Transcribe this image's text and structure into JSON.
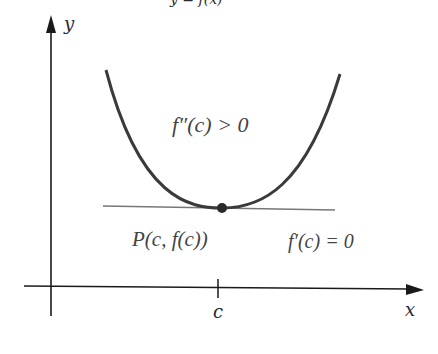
{
  "top_caption_fragment": "y = f(x)",
  "axes": {
    "x_label": "x",
    "y_label": "y",
    "tick_label": "c"
  },
  "annotations": {
    "concavity": "f″(c) > 0",
    "point": "P(c, f(c))",
    "slope": "f′(c) = 0"
  },
  "colors": {
    "axis": "#1a1a1a",
    "curve": "#3a3a3a",
    "tangent": "#777777",
    "point": "#2a2a2a",
    "text": "#444444"
  }
}
